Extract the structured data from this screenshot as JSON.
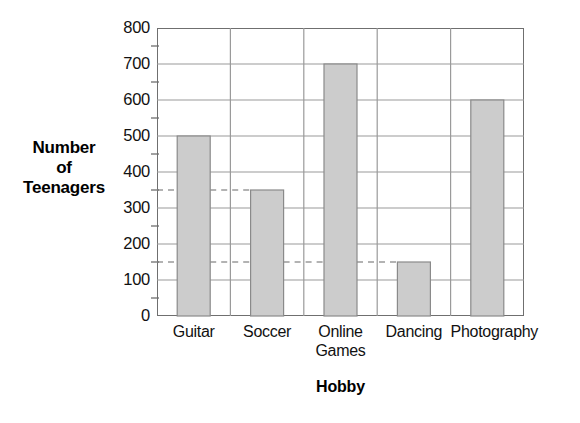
{
  "chart_data": {
    "type": "bar",
    "title": "",
    "xlabel": "Hobby",
    "ylabel": "Number of Teenagers",
    "ylabel_lines": [
      "Number",
      "of",
      "Teenagers"
    ],
    "categories": [
      "Guitar",
      "Soccer",
      "Online Games",
      "Dancing",
      "Photography"
    ],
    "category_label_lines": [
      [
        "Guitar"
      ],
      [
        "Soccer"
      ],
      [
        "Online",
        "Games"
      ],
      [
        "Dancing"
      ],
      [
        "Photography"
      ]
    ],
    "values": [
      500,
      350,
      700,
      150,
      600
    ],
    "ylim": [
      0,
      800
    ],
    "y_major_ticks": [
      0,
      100,
      200,
      300,
      400,
      500,
      600,
      700,
      800
    ],
    "y_tick_labels": [
      "0",
      "100",
      "200",
      "300",
      "400",
      "500",
      "600",
      "700",
      "800"
    ],
    "y_minor_ticks": [
      50,
      150,
      250,
      350,
      450,
      550,
      650,
      750
    ],
    "grid": true,
    "legend": "none",
    "annotations": [
      {
        "type": "dashed-reference-line",
        "value": 350,
        "extends_to_category": "Soccer"
      },
      {
        "type": "dashed-reference-line",
        "value": 150,
        "extends_to_category": "Dancing"
      }
    ],
    "colors": {
      "bar_fill": "#cccccc",
      "bar_stroke": "#8a8a8a",
      "gridline": "#9a9a9a",
      "axis": "#6f6f6f",
      "text": "#111111",
      "background": "#ffffff"
    }
  }
}
